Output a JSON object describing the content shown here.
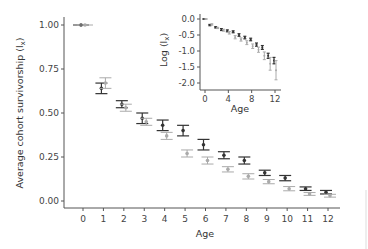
{
  "chart_data": [
    {
      "type": "scatter",
      "title": "",
      "xlabel": "Age",
      "ylabel": "Average cohort survivorship (l",
      "ylabel_subscript": "x",
      "ylabel_close": ")",
      "x": [
        0,
        1,
        2,
        3,
        4,
        5,
        6,
        7,
        8,
        9,
        10,
        11,
        12
      ],
      "xticks": [
        "0",
        "1",
        "2",
        "3",
        "4",
        "5",
        "6",
        "7",
        "8",
        "9",
        "10",
        "11",
        "12"
      ],
      "yticks": [
        "0.00",
        "0.25",
        "0.50",
        "0.75",
        "1.00"
      ],
      "ylim": [
        0,
        1
      ],
      "grid": false,
      "legend": null,
      "error_bars": true,
      "series": [
        {
          "name": "dark",
          "color": "#333333",
          "values": [
            1.0,
            0.64,
            0.55,
            0.47,
            0.43,
            0.4,
            0.32,
            0.26,
            0.23,
            0.16,
            0.13,
            0.07,
            0.05
          ],
          "err": [
            0.0,
            0.03,
            0.02,
            0.03,
            0.03,
            0.03,
            0.03,
            0.02,
            0.02,
            0.015,
            0.015,
            0.01,
            0.01
          ]
        },
        {
          "name": "light",
          "color": "#aaaaaa",
          "values": [
            1.0,
            0.67,
            0.53,
            0.45,
            0.37,
            0.27,
            0.23,
            0.18,
            0.14,
            0.11,
            0.07,
            0.04,
            0.03
          ],
          "err": [
            0.0,
            0.03,
            0.02,
            0.02,
            0.02,
            0.02,
            0.02,
            0.015,
            0.015,
            0.012,
            0.012,
            0.008,
            0.008
          ]
        }
      ]
    },
    {
      "type": "scatter",
      "title": "inset",
      "xlabel": "Age",
      "ylabel": "Log (l",
      "ylabel_subscript": "x",
      "ylabel_close": ")",
      "x": [
        0,
        1,
        2,
        3,
        4,
        5,
        6,
        7,
        8,
        9,
        10,
        11,
        12
      ],
      "xticks": [
        "0",
        "4",
        "8",
        "12"
      ],
      "yticks": [
        "0.0",
        "-0.5",
        "-1.0",
        "-1.5",
        "-2.0"
      ],
      "ylim": [
        -2.1,
        0.05
      ],
      "grid": false,
      "error_bars": true,
      "series": [
        {
          "name": "dark",
          "color": "#333333",
          "values": [
            0.0,
            -0.19,
            -0.26,
            -0.33,
            -0.37,
            -0.4,
            -0.5,
            -0.58,
            -0.64,
            -0.8,
            -0.89,
            -1.15,
            -1.3
          ],
          "err": [
            0.0,
            0.02,
            0.02,
            0.03,
            0.03,
            0.03,
            0.04,
            0.04,
            0.04,
            0.05,
            0.06,
            0.08,
            0.1
          ]
        },
        {
          "name": "light",
          "color": "#aaaaaa",
          "values": [
            0.0,
            -0.17,
            -0.28,
            -0.35,
            -0.43,
            -0.57,
            -0.64,
            -0.74,
            -0.85,
            -0.96,
            -1.15,
            -1.4,
            -1.6
          ],
          "err": [
            0.0,
            0.02,
            0.02,
            0.03,
            0.04,
            0.05,
            0.05,
            0.06,
            0.07,
            0.08,
            0.12,
            0.2,
            0.3
          ]
        }
      ]
    }
  ]
}
